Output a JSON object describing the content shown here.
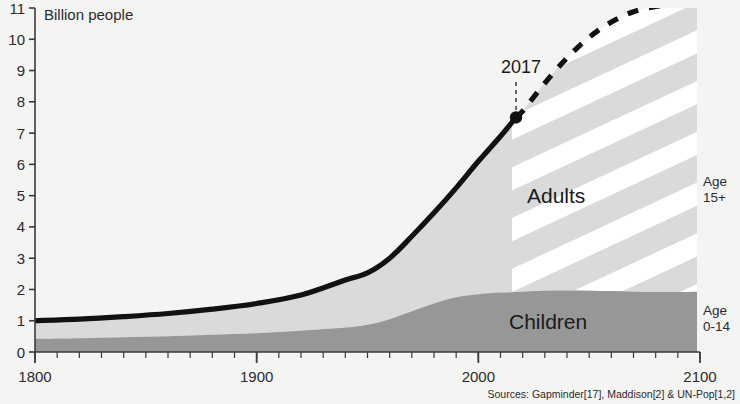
{
  "chart_data": {
    "type": "area",
    "title": "",
    "subtitle": "",
    "ylabel": "Billion people",
    "xlabel": "",
    "xlim": [
      1800,
      2100
    ],
    "ylim": [
      0,
      11
    ],
    "grid": false,
    "legend_position": "in-chart",
    "y_ticks": [
      0,
      1,
      2,
      3,
      4,
      5,
      6,
      7,
      8,
      9,
      10,
      11
    ],
    "y_tick_labels": [
      "0",
      "1",
      "2",
      "3",
      "4",
      "5",
      "6",
      "7",
      "8",
      "9",
      "10",
      "11"
    ],
    "x_ticks": [
      1800,
      1900,
      2000,
      2100
    ],
    "x_tick_labels": [
      "1800",
      "1900",
      "2000",
      "2100"
    ],
    "x_minor_tick_step": 10,
    "projection_start_year": 2017,
    "annotation": {
      "label": "2017",
      "year": 2017,
      "value": 7.5
    },
    "x": [
      1800,
      1820,
      1840,
      1860,
      1880,
      1900,
      1920,
      1940,
      1950,
      1960,
      1970,
      1980,
      1990,
      2000,
      2010,
      2017,
      2020,
      2030,
      2040,
      2050,
      2060,
      2070,
      2080,
      2090,
      2100
    ],
    "series": [
      {
        "name": "Children",
        "label": "Children",
        "side_label_line1": "Age",
        "side_label_line2": "0-14",
        "color": "#979797",
        "values": [
          0.42,
          0.44,
          0.47,
          0.5,
          0.55,
          0.6,
          0.68,
          0.78,
          0.87,
          1.05,
          1.3,
          1.55,
          1.75,
          1.85,
          1.9,
          1.92,
          1.93,
          1.96,
          1.97,
          1.96,
          1.95,
          1.93,
          1.92,
          1.92,
          1.93
        ]
      },
      {
        "name": "Adults",
        "label": "Adults",
        "side_label_line1": "Age",
        "side_label_line2": "15+",
        "color": "#dadada",
        "values": [
          0.58,
          0.61,
          0.66,
          0.73,
          0.82,
          0.95,
          1.14,
          1.52,
          1.66,
          1.95,
          2.4,
          2.9,
          3.5,
          4.25,
          5.0,
          5.58,
          5.77,
          6.64,
          7.43,
          8.1,
          8.6,
          8.95,
          9.13,
          9.2,
          9.17
        ]
      }
    ],
    "total_line": {
      "name": "Total population",
      "historical_values": [
        1.0,
        1.05,
        1.13,
        1.23,
        1.37,
        1.55,
        1.82,
        2.3,
        2.53,
        3.0,
        3.7,
        4.45,
        5.25,
        6.1,
        6.9,
        7.5
      ],
      "projected_values": [
        7.7,
        8.6,
        9.4,
        10.06,
        10.55,
        10.88,
        11.05,
        11.12,
        11.1
      ]
    },
    "stripes": {
      "description": "diagonal hatch marking projection region from 2017 to 2100",
      "color": "#ffffff"
    }
  },
  "source_note": "Sources: Gapminder[17], Maddison[2] & UN-Pop[1,2]"
}
